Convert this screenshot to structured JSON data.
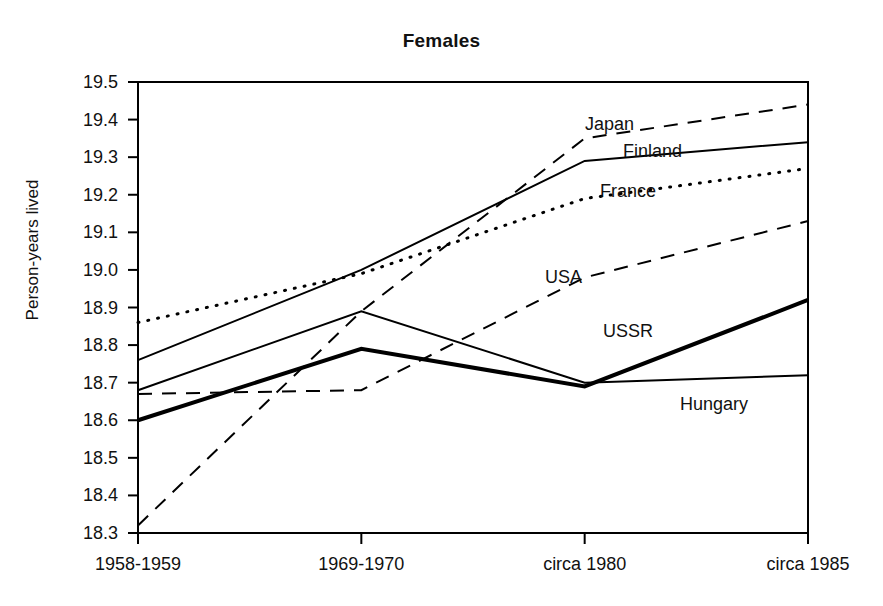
{
  "chart_data": {
    "type": "line",
    "title": "Females",
    "xlabel": "",
    "ylabel": "Person-years lived",
    "categories": [
      "1958-1959",
      "1969-1970",
      "circa 1980",
      "circa 1985"
    ],
    "ylim": [
      18.3,
      19.5
    ],
    "yticks": [
      "18.3",
      "18.4",
      "18.5",
      "18.6",
      "18.7",
      "18.8",
      "18.9",
      "19.0",
      "19.1",
      "19.2",
      "19.3",
      "19.4",
      "19.5"
    ],
    "grid": false,
    "legend_position": "inline-annotations",
    "series": [
      {
        "name": "Japan",
        "style": "dashed",
        "width": 2,
        "color": "#000000",
        "values": [
          18.32,
          18.89,
          19.35,
          19.44
        ],
        "label_x": 585,
        "label_y": 115
      },
      {
        "name": "Finland",
        "style": "solid",
        "width": 2,
        "color": "#000000",
        "values": [
          18.76,
          19.0,
          19.29,
          19.34
        ],
        "label_x": 623,
        "label_y": 142
      },
      {
        "name": "France",
        "style": "dotted",
        "width": 3,
        "color": "#000000",
        "values": [
          18.86,
          18.99,
          19.19,
          19.27
        ],
        "label_x": 600,
        "label_y": 182
      },
      {
        "name": "USA",
        "style": "dashed",
        "width": 2,
        "color": "#000000",
        "values": [
          18.67,
          18.68,
          18.98,
          19.13
        ],
        "label_x": 545,
        "label_y": 268
      },
      {
        "name": "USSR",
        "style": "solid",
        "width": 4,
        "color": "#000000",
        "values": [
          18.6,
          18.79,
          18.69,
          18.92
        ],
        "label_x": 603,
        "label_y": 322
      },
      {
        "name": "Hungary",
        "style": "solid",
        "width": 2,
        "color": "#000000",
        "values": [
          18.68,
          18.89,
          18.7,
          18.72
        ],
        "label_x": 680,
        "label_y": 395
      }
    ]
  },
  "axes": {
    "frame_color": "#000000",
    "plot_left": 138,
    "plot_right": 808,
    "plot_top": 82,
    "plot_bottom": 533
  }
}
